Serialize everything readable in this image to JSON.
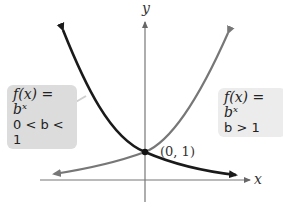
{
  "axes": {
    "x_label": "x",
    "y_label": "y"
  },
  "point": {
    "label": "(0, 1)"
  },
  "labels": {
    "decreasing": {
      "function": "f(x) = bˣ",
      "condition": "0 < b < 1"
    },
    "increasing": {
      "function": "f(x) = bˣ",
      "condition": "b > 1"
    }
  },
  "colors": {
    "decreasing_curve": "#1a1a1a",
    "increasing_curve": "#777777",
    "axes": "#666666",
    "left_box_bg": "#dcdcdc",
    "right_box_bg": "#ececec"
  }
}
